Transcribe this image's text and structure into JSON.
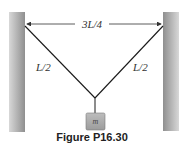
{
  "figure": {
    "caption": "Figure P16.30",
    "span_label": "3L/4",
    "left_rope_label": "L/2",
    "right_rope_label": "L/2",
    "mass_label": "m"
  },
  "colors": {
    "wall_dark": "#9a9a9a",
    "wall_light": "#d6d6d6",
    "rope": "#1a1a1a",
    "mass_fill": "#a8a8a8",
    "mass_stroke": "#7a7a7a",
    "arrow": "#333333"
  }
}
